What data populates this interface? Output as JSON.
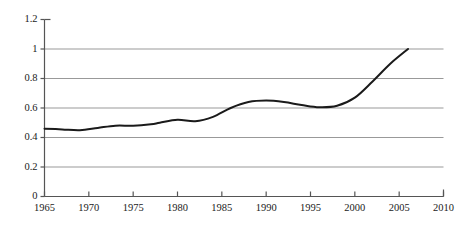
{
  "chart_data": {
    "type": "line",
    "title": "",
    "subtitle": "",
    "xlabel": "",
    "ylabel": "",
    "xlim": [
      1965,
      2010
    ],
    "ylim": [
      0,
      1.2
    ],
    "xticks": [
      1965,
      1970,
      1975,
      1980,
      1985,
      1990,
      1995,
      2000,
      2005,
      2010
    ],
    "xtick_labels": [
      "1965",
      "1970",
      "1975",
      "1980",
      "1985",
      "1990",
      "1995",
      "2000",
      "2005",
      "2010"
    ],
    "yticks": [
      0,
      0.2,
      0.4,
      0.6,
      0.8,
      1,
      1.2
    ],
    "ytick_labels": [
      "0",
      "0.2",
      "0.4",
      "0.6",
      "0.8",
      "1",
      "1.2"
    ],
    "grid": {
      "horizontal": true,
      "vertical": false,
      "gridline_values": [
        0.2,
        0.4,
        0.6,
        0.8,
        1
      ],
      "color": "#999999"
    },
    "legend": {
      "visible": false,
      "position": "none",
      "entries": []
    },
    "annotations": [],
    "axis_color": "#555555",
    "line_color": "#1a1a1a",
    "line_width": 2,
    "series": [
      {
        "name": "series-1",
        "color": "#1a1a1a",
        "x": [
          1965,
          1967,
          1969,
          1971,
          1973,
          1975,
          1977,
          1978,
          1980,
          1982,
          1984,
          1986,
          1988,
          1990,
          1992,
          1994,
          1996,
          1998,
          2000,
          2002,
          2004,
          2006
        ],
        "values": [
          0.46,
          0.455,
          0.45,
          0.465,
          0.48,
          0.48,
          0.49,
          0.5,
          0.52,
          0.51,
          0.54,
          0.6,
          0.64,
          0.65,
          0.64,
          0.62,
          0.605,
          0.615,
          0.67,
          0.78,
          0.9,
          1.0
        ]
      }
    ]
  }
}
